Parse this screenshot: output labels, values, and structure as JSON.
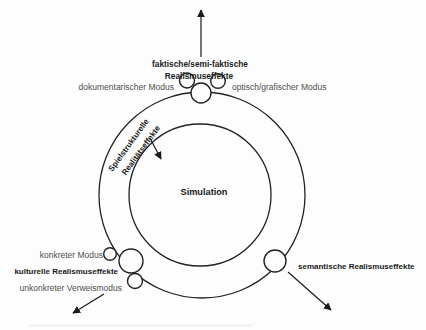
{
  "figure": {
    "type": "concentric-circle-diagram",
    "colors": {
      "background": "#fdfdfd",
      "line": "#222222",
      "title_text": "#1a1a1a",
      "modus_text": "#4d4d4d"
    }
  },
  "center": {
    "label": "Simulation"
  },
  "ring": {
    "label_line1": "Spielstrukturelle",
    "label_line2": "Realitätseffekte"
  },
  "top": {
    "title_line1": "faktische/semi-faktische",
    "title_line2": "Realismuseffekte",
    "left_modus": "dokumentarischer Modus",
    "right_modus": "optisch/grafischer Modus"
  },
  "bottom_left": {
    "title": "kulturelle Realismuseffekte",
    "upper_modus": "konkreter Modus",
    "lower_modus": "unkonkreter Verweismodus"
  },
  "right": {
    "title": "semantische Realismuseffekte"
  }
}
